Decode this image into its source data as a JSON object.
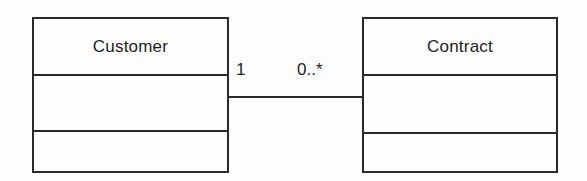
{
  "diagram": {
    "type": "uml-class-diagram",
    "background_color": "#fdfdfd",
    "line_color": "#2a2a2a",
    "text_color": "#1d1d1d",
    "classes": [
      {
        "id": "customer",
        "name": "Customer",
        "compartments": [
          "name",
          "attributes",
          "operations"
        ],
        "attributes": [],
        "operations": []
      },
      {
        "id": "contract",
        "name": "Contract",
        "compartments": [
          "name",
          "attributes",
          "operations"
        ],
        "attributes": [],
        "operations": []
      }
    ],
    "association": {
      "kind": "association",
      "source": "Customer",
      "target": "Contract",
      "source_multiplicity": "1",
      "target_multiplicity": "0..*",
      "label": ""
    }
  }
}
